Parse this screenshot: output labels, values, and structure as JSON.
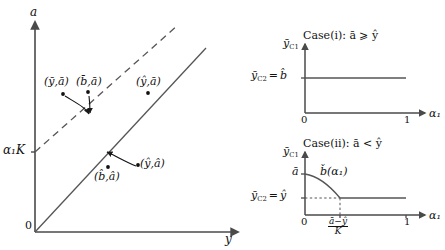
{
  "figure": {
    "type": "diagram"
  },
  "left_panel": {
    "y_axis_label": "a",
    "x_axis_label": "y",
    "origin_label": "0",
    "y_tick_label": "α₁K",
    "points": [
      {
        "id": "p1",
        "label": "(ȳ,ā)"
      },
      {
        "id": "p2",
        "label": "(b̄,ā)"
      },
      {
        "id": "p3",
        "label": "(ŷ,ā)"
      },
      {
        "id": "p4",
        "label": "(b̂,â)"
      },
      {
        "id": "p5",
        "label": "(ŷ,â)"
      }
    ],
    "lines": [
      {
        "id": "dashed-line",
        "style": "dashed",
        "meaning": "upper line with intercept α₁K"
      },
      {
        "id": "solid-line",
        "style": "solid",
        "meaning": "lower line through origin"
      }
    ]
  },
  "top_right_panel": {
    "case_title": "Case(i): ā ⩾ ŷ",
    "y_axis_label": "ȳ",
    "y_axis_sub": "C1",
    "x_axis_label": "α₁",
    "level_label_left": "ȳ",
    "level_label_left_sub": "C2",
    "level_label_eq": "=",
    "level_label_value": "b̂",
    "x_ticks": [
      "0",
      "1"
    ],
    "curve": {
      "type": "constant",
      "value_label": "b̂"
    }
  },
  "bottom_right_panel": {
    "case_title": "Case(ii): ā < ŷ",
    "y_axis_label": "ȳ",
    "y_axis_sub": "C1",
    "x_axis_label": "α₁",
    "intercept_label": "ā",
    "curve_label": "b̌(α₁)",
    "level_label_left": "ȳ",
    "level_label_left_sub": "C2",
    "level_label_eq": "=",
    "level_label_value": "ŷ",
    "x_ticks": [
      "0",
      "1"
    ],
    "breakpoint_numerator": "ā−ŷ",
    "breakpoint_denominator": "K"
  },
  "colors": {
    "ink": "#1a1a1a",
    "axis": "#4a4a4a",
    "line": "#555555"
  }
}
